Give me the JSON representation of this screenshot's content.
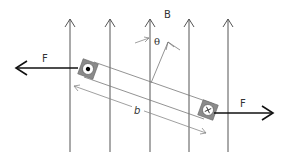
{
  "diagram": {
    "type": "physics-diagram",
    "labels": {
      "field": "B",
      "angle": "θ",
      "force_left": "F",
      "force_right": "F",
      "length": "b"
    },
    "symbols": {
      "left_conductor": "current-out-of-page-dot",
      "right_conductor": "current-into-page-cross",
      "cross_glyph": "×"
    },
    "field_lines_x": [
      70,
      110,
      150,
      190,
      230
    ],
    "colors": {
      "field_line": "#555555",
      "bar": "#777777",
      "force_arrow": "#111111",
      "conductor_fill": "#888888",
      "conductor_inner": "#ffffff",
      "dimension": "#888888"
    }
  }
}
